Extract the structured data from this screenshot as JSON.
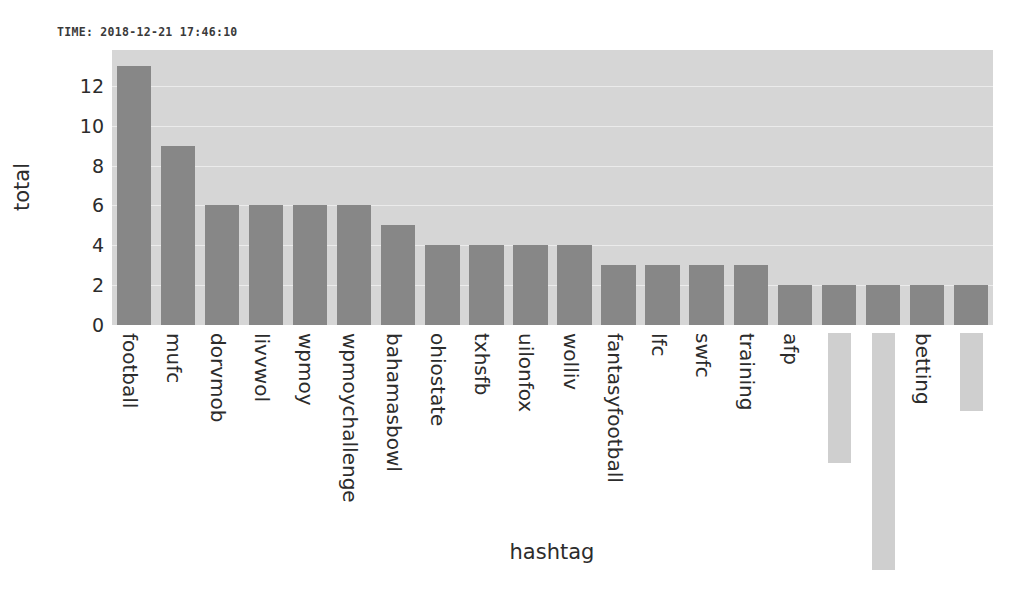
{
  "timestamp": {
    "label": "TIME: 2018-12-21 17:46:10"
  },
  "axis": {
    "xlabel": "hashtag",
    "ylabel": "total"
  },
  "chart_data": {
    "type": "bar",
    "title": "",
    "subtitle": "",
    "xlabel": "hashtag",
    "ylabel": "total",
    "ylim": [
      0,
      13.8
    ],
    "yticks": [
      0,
      2,
      4,
      6,
      8,
      10,
      12
    ],
    "ytick_labels": [
      "0",
      "2",
      "4",
      "6",
      "8",
      "10",
      "12"
    ],
    "grid": true,
    "legend": null,
    "orientation": "vertical",
    "bar_color": "#878787",
    "plot_background": "#d6d6d6",
    "categories": [
      "football",
      "mufc",
      "dorvmob",
      "livvwol",
      "wpmoy",
      "wpmoychallenge",
      "bahamasbowl",
      "ohiostate",
      "txhsfb",
      "uilonfox",
      "wolliv",
      "fantasyfootball",
      "lfc",
      "swfc",
      "training",
      "afp",
      "",
      "",
      "betting",
      ""
    ],
    "values": [
      13,
      9,
      6,
      6,
      6,
      6,
      5,
      4,
      4,
      4,
      4,
      3,
      3,
      3,
      3,
      2,
      2,
      2,
      2,
      2
    ],
    "redacted_labels": [
      16,
      17,
      19
    ]
  }
}
